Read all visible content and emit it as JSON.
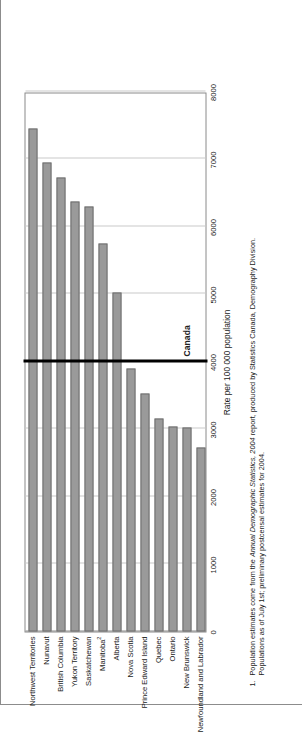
{
  "chart_data": {
    "type": "bar",
    "orientation": "horizontal",
    "title": "",
    "xlabel": "Rate per 100 000 population",
    "ylabel": "",
    "xlim": [
      0,
      8000
    ],
    "xticks": [
      0,
      1000,
      2000,
      3000,
      4000,
      5000,
      6000,
      7000,
      8000
    ],
    "xtick_labels": [
      "0",
      "1000",
      "2000",
      "3000",
      "4000",
      "5000",
      "6000",
      "7000",
      "8000"
    ],
    "grid": true,
    "legend": "none",
    "bar_color": "#9a9a9a",
    "bar_edge_color": "#6e6e6e",
    "categories": [
      "Northwest Territories",
      "Nunavut",
      "British Columbia",
      "Yukon Territory",
      "Saskatchewan",
      "Manitoba",
      "Alberta",
      "Nova Scotia",
      "Prince Edward Island",
      "Quebec",
      "Ontario",
      "New Brunswick",
      "Newfoundland and Labrador"
    ],
    "category_footnote_markers": [
      "",
      "",
      "",
      "",
      "",
      "2",
      "",
      "",
      "",
      "",
      "",
      "",
      ""
    ],
    "values": [
      7450,
      6950,
      6720,
      6370,
      6300,
      5750,
      5020,
      3900,
      3520,
      3160,
      3030,
      3020,
      2720
    ],
    "reference_line": {
      "label": "Canada",
      "value": 4000,
      "color": "#000000"
    }
  },
  "axis": {
    "value_axis_title": "Rate per 100 000 population"
  },
  "footnotes": [
    {
      "marker": "1.",
      "text_before_italic": "Population estimates come from the ",
      "italic": "Annual Demographic Statistics, 2004",
      "text_after_italic": " report, produced by Statistics Canada, Demography Division.",
      "line2": "Populations as of July 1st; preliminary postcensal estimates for 2004."
    }
  ]
}
